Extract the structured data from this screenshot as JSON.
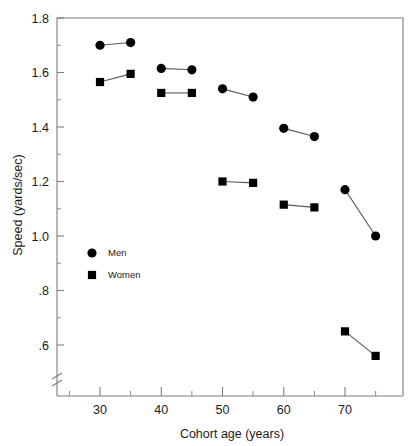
{
  "chart_data": {
    "type": "scatter",
    "title": "",
    "xlabel": "Cohort age (years)",
    "ylabel": "Speed (yards/sec)",
    "xlim": [
      24,
      79
    ],
    "ylim": [
      0.5,
      1.8
    ],
    "grid": false,
    "legend_position": "inside-left",
    "x_ticks_major": [
      30,
      40,
      50,
      60,
      70
    ],
    "x_tick_labels": [
      "30",
      "40",
      "50",
      "60",
      "70"
    ],
    "x_ticks_minor": [
      25,
      35,
      45,
      55,
      65,
      75
    ],
    "y_ticks": [
      1.8,
      1.6,
      1.4,
      1.2,
      1.0,
      0.8,
      0.6
    ],
    "y_tick_labels": [
      "1.8",
      "1.6",
      "1.4",
      "1.2",
      "1.0",
      ".8",
      ".6"
    ],
    "axis_break": {
      "axis": "y",
      "present": true,
      "note": "break below .6 on y-axis near origin"
    },
    "series": [
      {
        "name": "Men",
        "marker": "circle",
        "color": "#000000",
        "points": [
          {
            "x": 30,
            "y": 1.7
          },
          {
            "x": 35,
            "y": 1.71
          },
          {
            "x": 40,
            "y": 1.615
          },
          {
            "x": 45,
            "y": 1.61
          },
          {
            "x": 50,
            "y": 1.54
          },
          {
            "x": 55,
            "y": 1.51
          },
          {
            "x": 60,
            "y": 1.395
          },
          {
            "x": 65,
            "y": 1.365
          },
          {
            "x": 70,
            "y": 1.17
          },
          {
            "x": 75,
            "y": 1.0
          }
        ],
        "segments": [
          [
            30,
            35
          ],
          [
            40,
            45
          ],
          [
            50,
            55
          ],
          [
            60,
            65
          ],
          [
            70,
            75
          ]
        ]
      },
      {
        "name": "Women",
        "marker": "square",
        "color": "#000000",
        "points": [
          {
            "x": 30,
            "y": 1.565
          },
          {
            "x": 35,
            "y": 1.595
          },
          {
            "x": 40,
            "y": 1.525
          },
          {
            "x": 45,
            "y": 1.525
          },
          {
            "x": 50,
            "y": 1.2
          },
          {
            "x": 55,
            "y": 1.195
          },
          {
            "x": 60,
            "y": 1.115
          },
          {
            "x": 65,
            "y": 1.105
          },
          {
            "x": 70,
            "y": 0.65
          },
          {
            "x": 75,
            "y": 0.56
          }
        ],
        "segments": [
          [
            30,
            35
          ],
          [
            40,
            45
          ],
          [
            50,
            55
          ],
          [
            60,
            65
          ],
          [
            70,
            75
          ]
        ]
      }
    ],
    "legend": [
      {
        "label": "Men",
        "marker": "circle"
      },
      {
        "label": "Women",
        "marker": "square"
      }
    ]
  }
}
